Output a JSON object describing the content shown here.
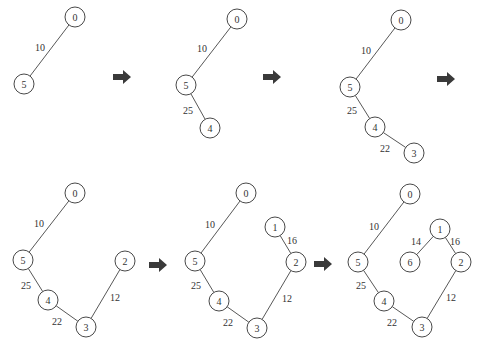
{
  "node_radius": 10,
  "colors": {
    "stroke": "#333333",
    "arrow": "#3a3a3a",
    "background": "#ffffff"
  },
  "arrows": [
    {
      "x": 122,
      "y": 77
    },
    {
      "x": 272,
      "y": 77
    },
    {
      "x": 446,
      "y": 79
    },
    {
      "x": 158,
      "y": 265
    },
    {
      "x": 323,
      "y": 264
    }
  ],
  "panels": [
    {
      "step": 1,
      "nodes": [
        {
          "id": "0",
          "x": 75,
          "y": 17
        },
        {
          "id": "5",
          "x": 24,
          "y": 84
        }
      ],
      "edges": [
        {
          "from": "0",
          "to": "5",
          "weight": "10",
          "lx": 40,
          "ly": 47
        }
      ]
    },
    {
      "step": 2,
      "nodes": [
        {
          "id": "0",
          "x": 237,
          "y": 19
        },
        {
          "id": "5",
          "x": 186,
          "y": 85
        },
        {
          "id": "4",
          "x": 210,
          "y": 128
        }
      ],
      "edges": [
        {
          "from": "0",
          "to": "5",
          "weight": "10",
          "lx": 202,
          "ly": 48
        },
        {
          "from": "5",
          "to": "4",
          "weight": "25",
          "lx": 188,
          "ly": 110
        }
      ]
    },
    {
      "step": 3,
      "nodes": [
        {
          "id": "0",
          "x": 401,
          "y": 20
        },
        {
          "id": "5",
          "x": 350,
          "y": 87
        },
        {
          "id": "4",
          "x": 375,
          "y": 127
        },
        {
          "id": "3",
          "x": 414,
          "y": 153
        }
      ],
      "edges": [
        {
          "from": "0",
          "to": "5",
          "weight": "10",
          "lx": 366,
          "ly": 50
        },
        {
          "from": "5",
          "to": "4",
          "weight": "25",
          "lx": 352,
          "ly": 110
        },
        {
          "from": "4",
          "to": "3",
          "weight": "22",
          "lx": 385,
          "ly": 148
        }
      ]
    },
    {
      "step": 4,
      "nodes": [
        {
          "id": "0",
          "x": 75,
          "y": 193
        },
        {
          "id": "5",
          "x": 23,
          "y": 260
        },
        {
          "id": "4",
          "x": 48,
          "y": 300
        },
        {
          "id": "3",
          "x": 86,
          "y": 327
        },
        {
          "id": "2",
          "x": 125,
          "y": 261
        }
      ],
      "edges": [
        {
          "from": "0",
          "to": "5",
          "weight": "10",
          "lx": 39,
          "ly": 223
        },
        {
          "from": "5",
          "to": "4",
          "weight": "25",
          "lx": 26,
          "ly": 285
        },
        {
          "from": "4",
          "to": "3",
          "weight": "22",
          "lx": 57,
          "ly": 321
        },
        {
          "from": "3",
          "to": "2",
          "weight": "12",
          "lx": 115,
          "ly": 297
        }
      ]
    },
    {
      "step": 5,
      "nodes": [
        {
          "id": "0",
          "x": 246,
          "y": 193
        },
        {
          "id": "5",
          "x": 195,
          "y": 261
        },
        {
          "id": "4",
          "x": 219,
          "y": 301
        },
        {
          "id": "3",
          "x": 257,
          "y": 328
        },
        {
          "id": "2",
          "x": 296,
          "y": 262
        },
        {
          "id": "1",
          "x": 275,
          "y": 227
        }
      ],
      "edges": [
        {
          "from": "0",
          "to": "5",
          "weight": "10",
          "lx": 210,
          "ly": 224
        },
        {
          "from": "5",
          "to": "4",
          "weight": "25",
          "lx": 196,
          "ly": 285
        },
        {
          "from": "4",
          "to": "3",
          "weight": "22",
          "lx": 228,
          "ly": 322
        },
        {
          "from": "3",
          "to": "2",
          "weight": "12",
          "lx": 287,
          "ly": 298
        },
        {
          "from": "2",
          "to": "1",
          "weight": "16",
          "lx": 292,
          "ly": 240
        }
      ]
    },
    {
      "step": 6,
      "nodes": [
        {
          "id": "0",
          "x": 410,
          "y": 194
        },
        {
          "id": "5",
          "x": 358,
          "y": 262
        },
        {
          "id": "4",
          "x": 384,
          "y": 301
        },
        {
          "id": "3",
          "x": 422,
          "y": 327
        },
        {
          "id": "2",
          "x": 461,
          "y": 262
        },
        {
          "id": "1",
          "x": 440,
          "y": 229
        },
        {
          "id": "6",
          "x": 410,
          "y": 262
        }
      ],
      "edges": [
        {
          "from": "0",
          "to": "5",
          "weight": "10",
          "lx": 374,
          "ly": 226
        },
        {
          "from": "5",
          "to": "4",
          "weight": "25",
          "lx": 361,
          "ly": 285
        },
        {
          "from": "4",
          "to": "3",
          "weight": "22",
          "lx": 392,
          "ly": 322
        },
        {
          "from": "3",
          "to": "2",
          "weight": "12",
          "lx": 451,
          "ly": 297
        },
        {
          "from": "1",
          "to": "6",
          "weight": "14",
          "lx": 416,
          "ly": 241
        },
        {
          "from": "1",
          "to": "2",
          "weight": "16",
          "lx": 455,
          "ly": 241
        }
      ]
    }
  ]
}
